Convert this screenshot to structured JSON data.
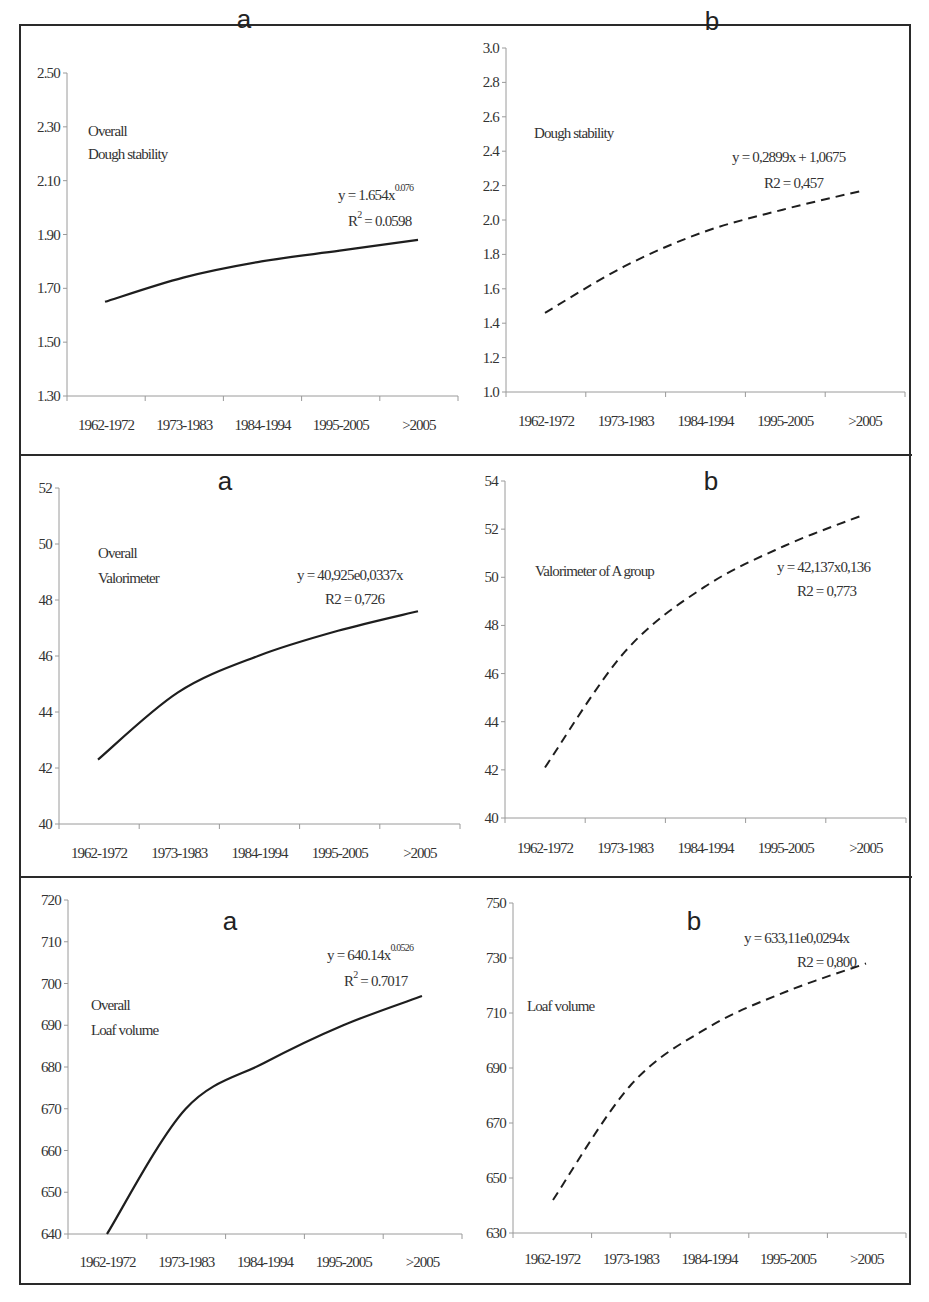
{
  "figure": {
    "x_categories": [
      "1962-1972",
      "1973-1983",
      "1984-1994",
      "1995-2005",
      ">2005"
    ]
  },
  "panels": [
    {
      "id": "dough-a",
      "letter": "a",
      "note_lines": [
        "Overall",
        "Dough stability"
      ],
      "equation": "y = 1.654x",
      "equation_sup": "0.076",
      "r2_prefix": "R",
      "r2_sup": "2",
      "r2_value": " = 0.0598",
      "y_ticks": [
        "2.50",
        "2.30",
        "2.10",
        "1.90",
        "1.70",
        "1.50",
        "1.30"
      ],
      "line_style": "solid"
    },
    {
      "id": "dough-b",
      "letter": "b",
      "note_lines": [
        "Dough stability"
      ],
      "equation": "y = 0,2899x + 1,0675",
      "equation_sup": "",
      "r2_prefix": "R2 = 0,457",
      "r2_sup": "",
      "r2_value": "",
      "y_ticks": [
        "3.0",
        "2.8",
        "2.6",
        "2.4",
        "2.2",
        "2.0",
        "1.8",
        "1.6",
        "1.4",
        "1.2",
        "1.0"
      ],
      "line_style": "dashed"
    },
    {
      "id": "valorimeter-a",
      "letter": "a",
      "note_lines": [
        "Overall",
        "Valorimeter"
      ],
      "equation": "y = 40,925e0,0337x",
      "equation_sup": "",
      "r2_prefix": "R2 = 0,726",
      "r2_sup": "",
      "r2_value": "",
      "y_ticks": [
        "52",
        "50",
        "48",
        "46",
        "44",
        "42",
        "40"
      ],
      "line_style": "solid"
    },
    {
      "id": "valorimeter-b",
      "letter": "b",
      "note_lines": [
        "Valorimeter of A group"
      ],
      "equation": "y = 42,137x0,136",
      "equation_sup": "",
      "r2_prefix": "R2 = 0,773",
      "r2_sup": "",
      "r2_value": "",
      "y_ticks": [
        "54",
        "52",
        "50",
        "48",
        "46",
        "44",
        "42",
        "40"
      ],
      "line_style": "dashed"
    },
    {
      "id": "loaf-a",
      "letter": "a",
      "note_lines": [
        "Overall",
        "Loaf volume"
      ],
      "equation": "y = 640.14x",
      "equation_sup": "0.0526",
      "r2_prefix": "R",
      "r2_sup": "2",
      "r2_value": " = 0.7017",
      "y_ticks": [
        "720",
        "710",
        "700",
        "690",
        "680",
        "670",
        "660",
        "650",
        "640"
      ],
      "line_style": "solid"
    },
    {
      "id": "loaf-b",
      "letter": "b",
      "note_lines": [
        "Loaf volume"
      ],
      "equation": "y = 633,11e0,0294x",
      "equation_sup": "",
      "r2_prefix": "R2 = 0,800",
      "r2_sup": "",
      "r2_value": "",
      "y_ticks": [
        "750",
        "730",
        "710",
        "690",
        "670",
        "650",
        "630"
      ],
      "line_style": "dashed"
    }
  ],
  "chart_data": [
    {
      "type": "line",
      "title": "a",
      "annotation": "Overall Dough stability",
      "categories": [
        "1962-1972",
        "1973-1983",
        "1984-1994",
        "1995-2005",
        ">2005"
      ],
      "series": [
        {
          "name": "Power trend (y = 1.654x^0.076, R² = 0.0598)",
          "values": [
            1.65,
            1.74,
            1.8,
            1.84,
            1.88
          ]
        }
      ],
      "ylim": [
        1.3,
        2.5
      ],
      "yticks": [
        1.3,
        1.5,
        1.7,
        1.9,
        2.1,
        2.3,
        2.5
      ],
      "line_style": "solid",
      "grid": false,
      "legend": "none"
    },
    {
      "type": "line",
      "title": "b",
      "annotation": "Dough stability",
      "categories": [
        "1962-1972",
        "1973-1983",
        "1984-1994",
        "1995-2005",
        ">2005"
      ],
      "series": [
        {
          "name": "Trend (y = 0,2899x + 1,0675, R2 = 0,457)",
          "values": [
            1.46,
            1.73,
            1.93,
            2.06,
            2.17
          ]
        }
      ],
      "ylim": [
        1.0,
        3.0
      ],
      "yticks": [
        1.0,
        1.2,
        1.4,
        1.6,
        1.8,
        2.0,
        2.2,
        2.4,
        2.6,
        2.8,
        3.0
      ],
      "line_style": "dashed",
      "grid": false,
      "legend": "none"
    },
    {
      "type": "line",
      "title": "a",
      "annotation": "Overall Valorimeter",
      "categories": [
        "1962-1972",
        "1973-1983",
        "1984-1994",
        "1995-2005",
        ">2005"
      ],
      "series": [
        {
          "name": "Trend (y = 40,925e0,0337x, R2 = 0,726)",
          "values": [
            42.3,
            44.7,
            46.0,
            46.9,
            47.6
          ]
        }
      ],
      "ylim": [
        40,
        52
      ],
      "yticks": [
        40,
        42,
        44,
        46,
        48,
        50,
        52
      ],
      "line_style": "solid",
      "grid": false,
      "legend": "none"
    },
    {
      "type": "line",
      "title": "b",
      "annotation": "Valorimeter of A group",
      "categories": [
        "1962-1972",
        "1973-1983",
        "1984-1994",
        "1995-2005",
        ">2005"
      ],
      "series": [
        {
          "name": "Trend (y = 42,137x0,136, R2 = 0,773)",
          "values": [
            42.1,
            46.9,
            49.6,
            51.3,
            52.6
          ]
        }
      ],
      "ylim": [
        40,
        54
      ],
      "yticks": [
        40,
        42,
        44,
        46,
        48,
        50,
        52,
        54
      ],
      "line_style": "dashed",
      "grid": false,
      "legend": "none"
    },
    {
      "type": "line",
      "title": "a",
      "annotation": "Overall Loaf volume",
      "categories": [
        "1962-1972",
        "1973-1983",
        "1984-1994",
        "1995-2005",
        ">2005"
      ],
      "series": [
        {
          "name": "Power trend (y = 640.14x^0.0526, R² = 0.7017)",
          "values": [
            640,
            670,
            681,
            690,
            697
          ]
        }
      ],
      "ylim": [
        640,
        720
      ],
      "yticks": [
        640,
        650,
        660,
        670,
        680,
        690,
        700,
        710,
        720
      ],
      "line_style": "solid",
      "grid": false,
      "legend": "none"
    },
    {
      "type": "line",
      "title": "b",
      "annotation": "Loaf volume",
      "categories": [
        "1962-1972",
        "1973-1983",
        "1984-1994",
        "1995-2005",
        ">2005"
      ],
      "series": [
        {
          "name": "Trend (y = 633,11e0,0294x, R2 = 0,800)",
          "values": [
            642,
            684,
            705,
            718,
            728
          ]
        }
      ],
      "ylim": [
        630,
        750
      ],
      "yticks": [
        630,
        650,
        670,
        690,
        710,
        730,
        750
      ],
      "line_style": "dashed",
      "grid": false,
      "legend": "none"
    }
  ]
}
